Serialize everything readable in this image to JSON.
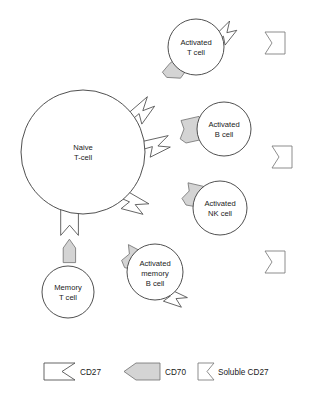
{
  "diagram": {
    "background_color": "#ffffff",
    "width": 312,
    "height": 400
  },
  "cells": [
    {
      "id": "naive-t-cell",
      "label_lines": [
        "Naive",
        "T-cell"
      ],
      "cx": 83,
      "cy": 152,
      "r": 62,
      "receptors": [
        "CD27",
        "CD27",
        "CD27",
        "CD27"
      ]
    },
    {
      "id": "activated-t-cell",
      "label_lines": [
        "Activated",
        "T cell"
      ],
      "cx": 196,
      "cy": 47,
      "r": 28,
      "receptors": [
        "CD27",
        "CD70"
      ]
    },
    {
      "id": "activated-b-cell",
      "label_lines": [
        "Activated",
        "B cell"
      ],
      "cx": 224,
      "cy": 129,
      "r": 27,
      "receptors": [
        "CD70"
      ]
    },
    {
      "id": "activated-nk-cell",
      "label_lines": [
        "Activated",
        "NK cell"
      ],
      "cx": 220,
      "cy": 208,
      "r": 27,
      "receptors": [
        "CD70"
      ]
    },
    {
      "id": "activated-memory-b-cell",
      "label_lines": [
        "Activated",
        "memory",
        "B cell"
      ],
      "cx": 155,
      "cy": 272,
      "r": 28,
      "receptors": [
        "CD70",
        "CD27"
      ]
    },
    {
      "id": "memory-t-cell",
      "label_lines": [
        "Memory",
        "T cell"
      ],
      "cx": 68,
      "cy": 292,
      "r": 26,
      "receptors": [
        "CD70"
      ]
    }
  ],
  "soluble_markers": [
    {
      "id": "soluble-cd27-1",
      "x": 265,
      "y": 32
    },
    {
      "id": "soluble-cd27-2",
      "x": 272,
      "y": 146
    },
    {
      "id": "soluble-cd27-3",
      "x": 265,
      "y": 251
    }
  ],
  "legend": {
    "items": [
      {
        "id": "legend-cd27",
        "label": "CD27",
        "shape": "cd27-receptor",
        "color": "#ffffff"
      },
      {
        "id": "legend-cd70",
        "label": "CD70",
        "shape": "cd70-ligand",
        "color": "#d4d4d4"
      },
      {
        "id": "legend-soluble-cd27",
        "label": "Soluble CD27",
        "shape": "soluble-cd27",
        "color": "#ffffff"
      }
    ]
  }
}
